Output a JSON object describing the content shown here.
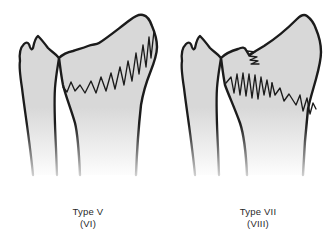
{
  "page": {
    "background": "#ffffff"
  },
  "panels": [
    {
      "name": "type-v",
      "caption_line1": "Type V",
      "caption_line2": "(VI)"
    },
    {
      "name": "type-vii",
      "caption_line1": "Type VII",
      "caption_line2": "(VIII)"
    }
  ],
  "colors": {
    "bone_fill": "#d8d8d8",
    "bone_fade": "#ffffff",
    "outline": "#1b1b1b",
    "caption_text": "#2a2a2a"
  }
}
